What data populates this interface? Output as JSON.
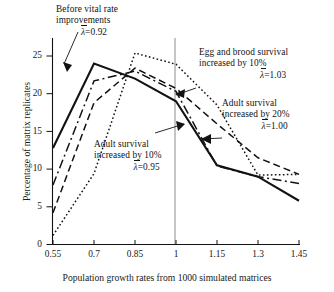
{
  "chart_data": {
    "type": "line",
    "title": "",
    "xlabel": "Population growth rates from 1000 simulated matrices",
    "ylabel": "Percentage of matrix replicates",
    "x": [
      0.55,
      0.7,
      0.85,
      1,
      1.15,
      1.3,
      1.45
    ],
    "xticklabels": [
      "0.55",
      "0.7",
      "0.85",
      "1",
      "1.15",
      "1.3",
      "1.45"
    ],
    "yticklabels": [
      "0",
      "5",
      "10",
      "15",
      "20",
      "25"
    ],
    "yticks": [
      0,
      5,
      10,
      15,
      20,
      25
    ],
    "xlim": [
      0.55,
      1.45
    ],
    "ylim": [
      0,
      26.5
    ],
    "grid": false,
    "legend": "annotations-inline",
    "reference_line_x": 1,
    "series": [
      {
        "name": "Before vital rate improvements",
        "style": "solid",
        "lambda": "0.92",
        "values": [
          12.8,
          24.0,
          22.0,
          19.0,
          10.5,
          9.0,
          5.8
        ]
      },
      {
        "name": "Adult survival increased by 10%",
        "style": "dash-dot",
        "lambda": "0.95",
        "values": [
          7.9,
          21.7,
          23.0,
          20.3,
          10.4,
          9.0,
          8.1
        ]
      },
      {
        "name": "Adult survival increased by 20%",
        "style": "dashed",
        "lambda": "1.00",
        "values": [
          4.2,
          18.8,
          23.4,
          20.7,
          16.0,
          11.5,
          9.3
        ]
      },
      {
        "name": "Egg and brood survival increased by 10%",
        "style": "dotted",
        "lambda": "1.03",
        "values": [
          1.2,
          9.4,
          25.4,
          23.9,
          18.5,
          9.2,
          9.3
        ]
      }
    ]
  },
  "annotations": {
    "before": {
      "line1": "Before vital rate",
      "line2": "improvements",
      "lambda": "=0.92",
      "lambda_symbol": "λ"
    },
    "egg": {
      "line1": "Egg and brood survival",
      "line2": "increased by 10%",
      "lambda": "=1.03",
      "lambda_symbol": "λ"
    },
    "adult20": {
      "line1": "Adult survival",
      "line2": "increased by 20%",
      "lambda": "=1.00",
      "lambda_symbol": "λ"
    },
    "adult10": {
      "line1": "Adult survival",
      "line2": "increased by 10%",
      "lambda": "=0.95",
      "lambda_symbol": "λ"
    }
  },
  "axes": {
    "x_label": "Population growth rates from 1000 simulated matrices",
    "y_label": "Percentage of matrix replicates"
  },
  "colors": {
    "ink": "#121212",
    "reference_line": "#8c8c8c",
    "background": "#ffffff"
  }
}
